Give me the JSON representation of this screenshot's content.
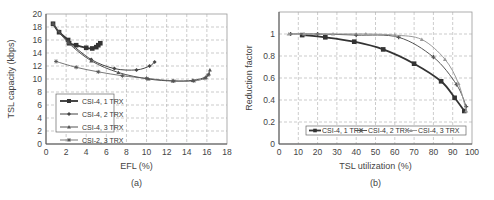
{
  "chart_data": [
    {
      "type": "line",
      "subtitle": "(a)",
      "xlabel": "EFL (%)",
      "ylabel": "TSL capacity (kbps)",
      "xlim": [
        0,
        18
      ],
      "ylim": [
        0,
        20
      ],
      "xticks": [
        0,
        2,
        4,
        6,
        8,
        10,
        12,
        14,
        16,
        18
      ],
      "yticks": [
        0,
        2,
        4,
        6,
        8,
        10,
        12,
        14,
        16,
        18,
        20
      ],
      "grid": true,
      "legend_position": "lower left",
      "series": [
        {
          "name": "CSI-4, 1 TRX",
          "marker": "square",
          "color": "#333333",
          "width": 1.8,
          "x": [
            0.7,
            1.3,
            2.2,
            2.3,
            3.0,
            4.0,
            4.6,
            5.0,
            5.2,
            5.4
          ],
          "y": [
            18.5,
            17.2,
            16.0,
            15.5,
            15.2,
            14.8,
            14.7,
            14.9,
            15.2,
            15.5
          ]
        },
        {
          "name": "CSI-4, 2 TRX",
          "marker": "diamond",
          "color": "#444444",
          "width": 1.0,
          "x": [
            0.7,
            1.3,
            2.2,
            4.5,
            6.8,
            9.0,
            10.3,
            10.8
          ],
          "y": [
            18.5,
            17.3,
            15.8,
            13.0,
            11.6,
            11.4,
            12.0,
            12.6
          ]
        },
        {
          "name": "CSI-4, 3 TRX",
          "marker": "triangle",
          "color": "#555555",
          "width": 1.0,
          "x": [
            0.7,
            2.2,
            4.5,
            7.2,
            10.2,
            12.6,
            14.6,
            15.9,
            16.2,
            16.3
          ],
          "y": [
            18.5,
            15.6,
            12.8,
            11.0,
            10.0,
            9.7,
            9.8,
            10.3,
            10.8,
            11.4
          ]
        },
        {
          "name": "CSI-2, 3 TRX",
          "marker": "star",
          "color": "#555555",
          "width": 0.8,
          "x": [
            1.0,
            3.0,
            5.2,
            7.6,
            10.0,
            12.7,
            14.7,
            15.8,
            16.1
          ],
          "y": [
            12.7,
            11.8,
            11.1,
            10.5,
            10.1,
            9.7,
            9.7,
            10.1,
            10.6
          ]
        }
      ]
    },
    {
      "type": "line",
      "subtitle": "(b)",
      "xlabel": "TSL utilization (%)",
      "ylabel": "Reduction factor",
      "xlim": [
        0,
        100
      ],
      "ylim": [
        0,
        1.2
      ],
      "xticks": [
        0,
        10,
        20,
        30,
        40,
        50,
        60,
        70,
        80,
        90,
        100
      ],
      "yticks": [
        0,
        0.2,
        0.4,
        0.6,
        0.8,
        1
      ],
      "ytick_labels": [
        "0",
        "0.2",
        "0.4",
        "0.6",
        "0.8",
        "1"
      ],
      "grid": true,
      "legend_position": "lower center",
      "series": [
        {
          "name": "CSI-4, 1 TRX",
          "marker": "square",
          "color": "#333333",
          "width": 1.8,
          "x": [
            12,
            24,
            39,
            54,
            70,
            84,
            91,
            96
          ],
          "y": [
            0.99,
            0.97,
            0.93,
            0.86,
            0.73,
            0.57,
            0.42,
            0.3
          ]
        },
        {
          "name": "CSI-4, 2 TRX",
          "marker": "plus",
          "color": "#555555",
          "width": 1.0,
          "x": [
            6,
            20,
            40,
            62,
            80,
            92,
            97
          ],
          "y": [
            1.0,
            1.0,
            0.99,
            0.97,
            0.79,
            0.54,
            0.34
          ]
        },
        {
          "name": "CSI-4, 3 TRX",
          "marker": "triangle",
          "color": "#999999",
          "width": 1.0,
          "x": [
            5,
            13,
            28,
            45,
            60,
            74,
            86,
            93,
            97
          ],
          "y": [
            1.0,
            1.0,
            1.0,
            1.0,
            0.99,
            0.95,
            0.77,
            0.55,
            0.3
          ]
        }
      ]
    }
  ]
}
